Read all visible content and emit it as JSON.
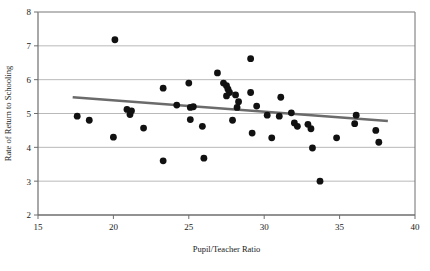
{
  "chart_data": {
    "type": "scatter",
    "title": "",
    "xlabel": "Pupil/Teacher Ratio",
    "ylabel": "Rate of Return to Schooling",
    "xlim": [
      15,
      40
    ],
    "ylim": [
      2,
      8
    ],
    "xticks": [
      15,
      20,
      25,
      30,
      35,
      40
    ],
    "yticks": [
      2,
      3,
      4,
      5,
      6,
      7,
      8
    ],
    "grid": "horizontal",
    "legend": "none",
    "marker_color": "#111111",
    "trendline_color": "#6b6b6b",
    "axis_color": "#6e6e6e",
    "points": [
      {
        "x": 17.6,
        "y": 4.92
      },
      {
        "x": 18.4,
        "y": 4.8
      },
      {
        "x": 20.1,
        "y": 7.18
      },
      {
        "x": 20.0,
        "y": 4.3
      },
      {
        "x": 20.9,
        "y": 5.12
      },
      {
        "x": 21.1,
        "y": 4.97
      },
      {
        "x": 21.2,
        "y": 5.08
      },
      {
        "x": 22.0,
        "y": 4.57
      },
      {
        "x": 23.3,
        "y": 5.75
      },
      {
        "x": 23.3,
        "y": 3.6
      },
      {
        "x": 24.2,
        "y": 5.25
      },
      {
        "x": 25.0,
        "y": 5.9
      },
      {
        "x": 25.1,
        "y": 5.18
      },
      {
        "x": 25.3,
        "y": 5.2
      },
      {
        "x": 25.1,
        "y": 4.82
      },
      {
        "x": 25.9,
        "y": 4.62
      },
      {
        "x": 26.0,
        "y": 3.68
      },
      {
        "x": 26.9,
        "y": 6.2
      },
      {
        "x": 27.3,
        "y": 5.9
      },
      {
        "x": 27.5,
        "y": 5.82
      },
      {
        "x": 27.6,
        "y": 5.72
      },
      {
        "x": 27.7,
        "y": 5.62
      },
      {
        "x": 27.5,
        "y": 5.52
      },
      {
        "x": 28.1,
        "y": 5.55
      },
      {
        "x": 28.3,
        "y": 5.35
      },
      {
        "x": 28.2,
        "y": 5.18
      },
      {
        "x": 27.9,
        "y": 4.8
      },
      {
        "x": 29.1,
        "y": 6.62
      },
      {
        "x": 29.1,
        "y": 5.62
      },
      {
        "x": 29.5,
        "y": 5.22
      },
      {
        "x": 29.2,
        "y": 4.42
      },
      {
        "x": 30.2,
        "y": 4.95
      },
      {
        "x": 30.5,
        "y": 4.28
      },
      {
        "x": 31.1,
        "y": 5.48
      },
      {
        "x": 31.0,
        "y": 4.92
      },
      {
        "x": 31.8,
        "y": 5.02
      },
      {
        "x": 32.0,
        "y": 4.72
      },
      {
        "x": 32.2,
        "y": 4.62
      },
      {
        "x": 33.1,
        "y": 4.55
      },
      {
        "x": 32.9,
        "y": 4.68
      },
      {
        "x": 33.2,
        "y": 3.98
      },
      {
        "x": 33.7,
        "y": 3.0
      },
      {
        "x": 34.8,
        "y": 4.28
      },
      {
        "x": 36.0,
        "y": 4.7
      },
      {
        "x": 36.1,
        "y": 4.95
      },
      {
        "x": 37.4,
        "y": 4.5
      },
      {
        "x": 37.6,
        "y": 4.15
      }
    ],
    "trendline": {
      "x0": 17.3,
      "y0": 5.48,
      "x1": 38.2,
      "y1": 4.78
    }
  }
}
